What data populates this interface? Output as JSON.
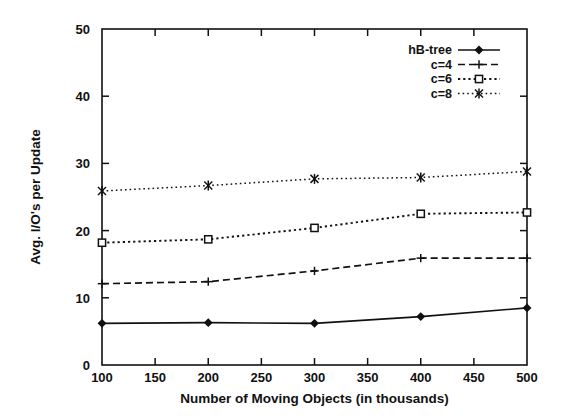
{
  "chart_data": {
    "type": "line",
    "title": "",
    "xlabel": "Number of Moving Objects (in thousands)",
    "ylabel": "Avg. I/O's per Update",
    "x": [
      100,
      200,
      300,
      400,
      500
    ],
    "xlim": [
      100,
      500
    ],
    "ylim": [
      0,
      50
    ],
    "xticks": [
      100,
      150,
      200,
      250,
      300,
      350,
      400,
      450,
      500
    ],
    "yticks": [
      0,
      10,
      20,
      30,
      40,
      50
    ],
    "xtick_labels": [
      "100",
      "150",
      "200",
      "250",
      "300",
      "350",
      "400",
      "450",
      "500"
    ],
    "ytick_labels": [
      "0",
      "10",
      "20",
      "30",
      "40",
      "50"
    ],
    "grid": false,
    "legend_position": "top-right",
    "series": [
      {
        "name": "hB-tree",
        "values": [
          6.2,
          6.3,
          6.2,
          7.2,
          8.5
        ],
        "marker": "filled-diamond",
        "linestyle": "solid",
        "color": "#111111"
      },
      {
        "name": "c=4",
        "values": [
          12.1,
          12.4,
          14.0,
          15.9,
          15.9
        ],
        "marker": "plus",
        "linestyle": "dashed",
        "color": "#111111"
      },
      {
        "name": "c=6",
        "values": [
          18.2,
          18.7,
          20.4,
          22.5,
          22.7
        ],
        "marker": "open-square",
        "linestyle": "dotted",
        "color": "#111111"
      },
      {
        "name": "c=8",
        "values": [
          25.9,
          26.7,
          27.7,
          27.9,
          28.8
        ],
        "marker": "cross-x",
        "linestyle": "fine-dotted",
        "color": "#111111"
      }
    ]
  },
  "axes": {
    "x_title": "Number of Moving Objects (in thousands)",
    "y_title": "Avg. I/O's per Update"
  },
  "legend": {
    "entries": [
      {
        "label": "hB-tree"
      },
      {
        "label": "c=4"
      },
      {
        "label": "c=6"
      },
      {
        "label": "c=8"
      }
    ]
  },
  "colors": {
    "ink": "#111111",
    "background": "#ffffff"
  }
}
